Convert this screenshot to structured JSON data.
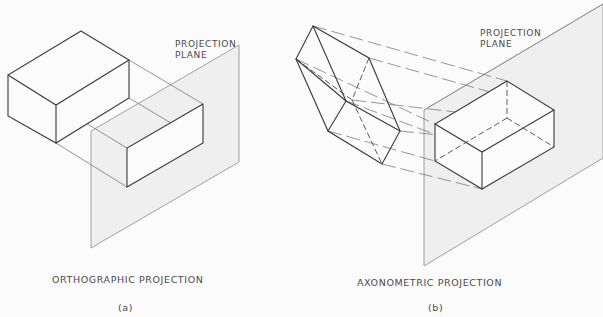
{
  "figure_a": {
    "plane_label_line1": "PROJECTION",
    "plane_label_line2": "PLANE",
    "caption": "ORTHOGRAPHIC PROJECTION",
    "sublabel": "(a)"
  },
  "figure_b": {
    "plane_label_line1": "PROJECTION",
    "plane_label_line2": "PLANE",
    "caption": "AXONOMETRIC PROJECTION",
    "sublabel": "(b)"
  },
  "colors": {
    "background": "#fbfbfb",
    "plane_fill": "#efefef",
    "line": "#3a3a3a"
  }
}
